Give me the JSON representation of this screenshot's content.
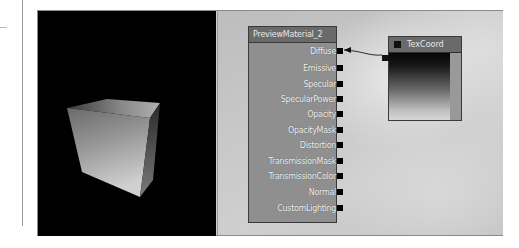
{
  "viewport": {
    "label": "preview-viewport",
    "shape": "cube"
  },
  "material_node": {
    "title": "PreviewMaterial_2",
    "inputs": [
      {
        "label": "Diffuse",
        "connected": true
      },
      {
        "label": "Emissive",
        "connected": false
      },
      {
        "label": "Specular",
        "connected": false
      },
      {
        "label": "SpecularPower",
        "connected": false
      },
      {
        "label": "Opacity",
        "connected": false
      },
      {
        "label": "OpacityMask",
        "connected": false
      },
      {
        "label": "Distortion",
        "connected": false
      },
      {
        "label": "TransmissionMask",
        "connected": false
      },
      {
        "label": "TransmissionColor",
        "connected": false
      },
      {
        "label": "Normal",
        "connected": false
      },
      {
        "label": "CustomLighting",
        "connected": false
      }
    ]
  },
  "texcoord_node": {
    "title": "TexCoord"
  },
  "colors": {
    "node_title": "#6a6a6a",
    "node_body": "#8f8f8f",
    "viewport_bg": "#000000"
  }
}
